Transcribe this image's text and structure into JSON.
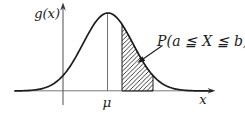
{
  "figure": {
    "labels": {
      "y_axis": "g(x)",
      "x_axis": "x",
      "mean": "μ",
      "probability": "P(a ≦ X ≦ b)"
    },
    "colors": {
      "background": "#ffffff",
      "curve": "#1c1c1c",
      "x_axis": "#7a7a7a",
      "y_axis": "#4f4f4f",
      "mean_line": "#4f4f4f",
      "hatch": "#1c1c1c",
      "annotation": "#1c1c1c",
      "text": "#1c1c1c"
    },
    "geometry": {
      "mean_x": 108,
      "sigma": 25,
      "baseline_y": 91,
      "peak_y": 13,
      "curve_from_x": 15,
      "curve_to_x": 212,
      "shaded_from_x": 122,
      "shaded_to_x": 153
    }
  }
}
